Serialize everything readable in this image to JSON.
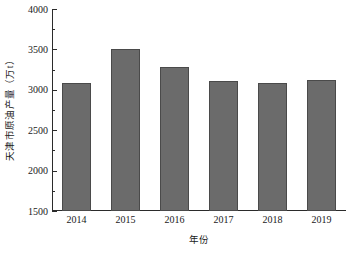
{
  "chart_data": {
    "type": "bar",
    "title": "",
    "xlabel": "年份",
    "ylabel": "天津市原油产量（万t）",
    "categories": [
      "2014",
      "2015",
      "2016",
      "2017",
      "2018",
      "2019"
    ],
    "values": [
      3080,
      3500,
      3280,
      3110,
      3090,
      3120
    ],
    "series": [
      {
        "name": "天津市原油产量",
        "values": [
          3080,
          3500,
          3280,
          3110,
          3090,
          3120
        ]
      }
    ],
    "ylim": [
      1500,
      4000
    ],
    "ytick_labels": [
      "1500",
      "2000",
      "2500",
      "3000",
      "3500",
      "4000"
    ],
    "ytick_values": [
      1500,
      2000,
      2500,
      3000,
      3500,
      4000
    ],
    "yminor_values": [
      1750,
      2250,
      2750,
      3250,
      3750
    ],
    "xtick_labels": [
      "2014",
      "2015",
      "2016",
      "2017",
      "2018",
      "2019"
    ],
    "grid": false,
    "legend": false,
    "legend_position": "none",
    "bar_color": "#6b6b6b",
    "bar_edge_color": "#4a4a4a",
    "axis_color": "#2b2b2b",
    "background_color": "#ffffff"
  }
}
